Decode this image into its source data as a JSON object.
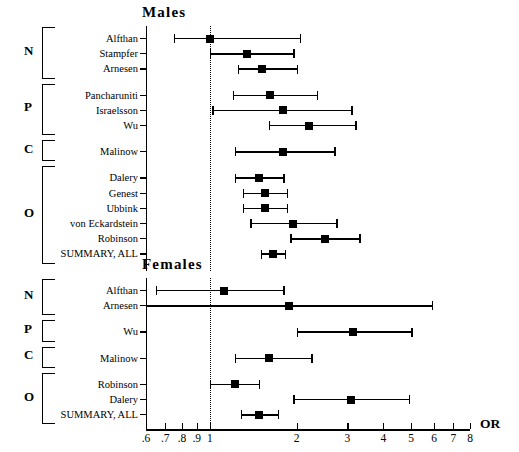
{
  "figure": {
    "axis_title": "OR",
    "scale": "log",
    "xmin": 0.6,
    "xmax": 8,
    "reference_value": 1,
    "tick_values": [
      0.6,
      0.7,
      0.8,
      0.9,
      1,
      2,
      3,
      4,
      5,
      6,
      7,
      8
    ],
    "tick_labels": [
      ".6",
      ".7",
      ".8",
      ".9",
      "1",
      "2",
      "3",
      "4",
      "5",
      "6",
      "7",
      "8"
    ]
  },
  "chart_data": {
    "type": "scatter",
    "xlabel": "OR",
    "ylabel": "",
    "xscale": "log",
    "xlim": [
      0.6,
      8
    ],
    "grid": false,
    "legend": "none",
    "reference_line": 1,
    "panels": [
      {
        "title": "Males",
        "groups": [
          {
            "letter": "N",
            "rows": [
              {
                "label": "Alfthan",
                "or": 1.0,
                "lcl": 0.75,
                "ucl": 2.05
              },
              {
                "label": "Stampfer",
                "or": 1.35,
                "lcl": 1.0,
                "ucl": 1.95
              },
              {
                "label": "Arnesen",
                "or": 1.52,
                "lcl": 1.25,
                "ucl": 2.0
              }
            ]
          },
          {
            "letter": "P",
            "rows": [
              {
                "label": "Pancharuniti",
                "or": 1.62,
                "lcl": 1.2,
                "ucl": 2.35
              },
              {
                "label": "Israelsson",
                "or": 1.8,
                "lcl": 1.02,
                "ucl": 3.1
              },
              {
                "label": "Wu",
                "or": 2.2,
                "lcl": 1.6,
                "ucl": 3.2
              }
            ]
          },
          {
            "letter": "C",
            "rows": [
              {
                "label": "Malinow",
                "or": 1.8,
                "lcl": 1.22,
                "ucl": 2.7
              }
            ]
          },
          {
            "letter": "O",
            "rows": [
              {
                "label": "Dalery",
                "or": 1.48,
                "lcl": 1.22,
                "ucl": 1.8
              },
              {
                "label": "Genest",
                "or": 1.55,
                "lcl": 1.3,
                "ucl": 1.85
              },
              {
                "label": "Ubbink",
                "or": 1.55,
                "lcl": 1.3,
                "ucl": 1.85
              },
              {
                "label": "von Eckardstein",
                "or": 1.95,
                "lcl": 1.38,
                "ucl": 2.75
              },
              {
                "label": "Robinson",
                "or": 2.5,
                "lcl": 1.9,
                "ucl": 3.3
              },
              {
                "label": "SUMMARY, ALL",
                "or": 1.65,
                "lcl": 1.5,
                "ucl": 1.82
              }
            ]
          }
        ]
      },
      {
        "title": "Females",
        "groups": [
          {
            "letter": "N",
            "rows": [
              {
                "label": "Alfthan",
                "or": 1.12,
                "lcl": 0.65,
                "ucl": 1.8
              },
              {
                "label": "Arnesen",
                "or": 1.88,
                "lcl": 0.6,
                "ucl": 5.9
              }
            ]
          },
          {
            "letter": "P",
            "rows": [
              {
                "label": "Wu",
                "or": 3.15,
                "lcl": 2.0,
                "ucl": 5.0
              }
            ]
          },
          {
            "letter": "C",
            "rows": [
              {
                "label": "Malinow",
                "or": 1.6,
                "lcl": 1.22,
                "ucl": 2.25
              }
            ]
          },
          {
            "letter": "O",
            "rows": [
              {
                "label": "Robinson",
                "or": 1.22,
                "lcl": 1.0,
                "ucl": 1.48
              },
              {
                "label": "Dalery",
                "or": 3.1,
                "lcl": 1.95,
                "ucl": 4.9
              },
              {
                "label": "SUMMARY, ALL",
                "or": 1.48,
                "lcl": 1.28,
                "ucl": 1.72
              }
            ]
          }
        ]
      }
    ]
  }
}
